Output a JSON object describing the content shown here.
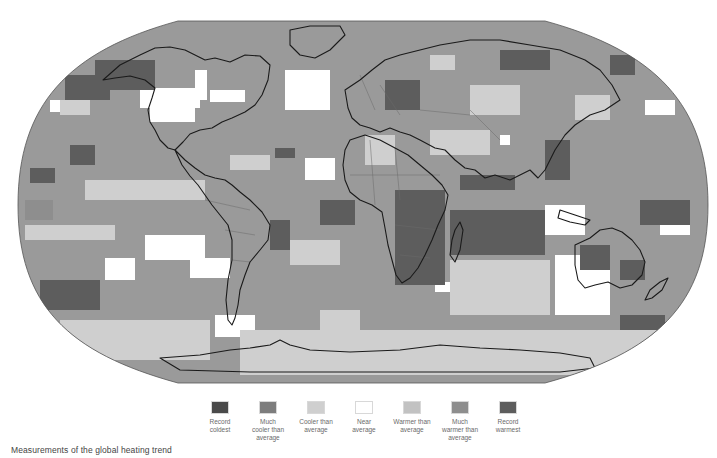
{
  "figure": {
    "caption": "Measurements of the global heating trend",
    "projection": "robinson",
    "outline": {
      "top_y": 21,
      "bottom_y": 383,
      "left_x": 18,
      "right_x": 708,
      "flat_top": [
        178,
        545
      ],
      "flat_bottom": [
        178,
        545
      ]
    }
  },
  "legend": {
    "items": [
      {
        "key": "record_coldest",
        "label": "Record\ncoldest",
        "color": "#4a4a4a"
      },
      {
        "key": "much_cooler",
        "label": "Much\ncooler than\naverage",
        "color": "#7d7d7d"
      },
      {
        "key": "cooler",
        "label": "Cooler than\naverage",
        "color": "#cfcfcf"
      },
      {
        "key": "near",
        "label": "Near\naverage",
        "color": "#ffffff"
      },
      {
        "key": "warmer",
        "label": "Warmer than\naverage",
        "color": "#c2c2c2"
      },
      {
        "key": "much_warmer",
        "label": "Much\nwarmer than\naverage",
        "color": "#8e8e8e"
      },
      {
        "key": "record_warmest",
        "label": "Record\nwarmest",
        "color": "#5d5d5d"
      }
    ]
  },
  "map": {
    "base_color": "#9a9a9a",
    "coast_color": "#1a1a1a",
    "border_color": "#6a6a6a",
    "cells": [
      {
        "x": 140,
        "y": 88,
        "w": 60,
        "h": 20,
        "c": "near"
      },
      {
        "x": 150,
        "y": 100,
        "w": 45,
        "h": 22,
        "c": "near"
      },
      {
        "x": 195,
        "y": 70,
        "w": 12,
        "h": 30,
        "c": "near"
      },
      {
        "x": 210,
        "y": 90,
        "w": 35,
        "h": 12,
        "c": "near"
      },
      {
        "x": 285,
        "y": 70,
        "w": 45,
        "h": 40,
        "c": "near"
      },
      {
        "x": 305,
        "y": 158,
        "w": 30,
        "h": 22,
        "c": "near"
      },
      {
        "x": 50,
        "y": 100,
        "w": 20,
        "h": 12,
        "c": "near"
      },
      {
        "x": 145,
        "y": 235,
        "w": 60,
        "h": 25,
        "c": "near"
      },
      {
        "x": 190,
        "y": 258,
        "w": 40,
        "h": 20,
        "c": "near"
      },
      {
        "x": 105,
        "y": 258,
        "w": 30,
        "h": 22,
        "c": "near"
      },
      {
        "x": 215,
        "y": 315,
        "w": 40,
        "h": 22,
        "c": "near"
      },
      {
        "x": 545,
        "y": 205,
        "w": 40,
        "h": 30,
        "c": "near"
      },
      {
        "x": 555,
        "y": 255,
        "w": 55,
        "h": 60,
        "c": "near"
      },
      {
        "x": 435,
        "y": 282,
        "w": 18,
        "h": 10,
        "c": "near"
      },
      {
        "x": 645,
        "y": 100,
        "w": 30,
        "h": 15,
        "c": "near"
      },
      {
        "x": 500,
        "y": 135,
        "w": 10,
        "h": 10,
        "c": "near"
      },
      {
        "x": 660,
        "y": 220,
        "w": 30,
        "h": 15,
        "c": "near"
      },
      {
        "x": 95,
        "y": 60,
        "w": 60,
        "h": 30,
        "c": "record_warmest"
      },
      {
        "x": 65,
        "y": 75,
        "w": 45,
        "h": 25,
        "c": "record_warmest"
      },
      {
        "x": 70,
        "y": 145,
        "w": 25,
        "h": 20,
        "c": "record_warmest"
      },
      {
        "x": 30,
        "y": 168,
        "w": 25,
        "h": 15,
        "c": "record_warmest"
      },
      {
        "x": 25,
        "y": 200,
        "w": 28,
        "h": 20,
        "c": "much_warmer"
      },
      {
        "x": 40,
        "y": 280,
        "w": 60,
        "h": 30,
        "c": "record_warmest"
      },
      {
        "x": 275,
        "y": 148,
        "w": 20,
        "h": 10,
        "c": "record_warmest"
      },
      {
        "x": 610,
        "y": 55,
        "w": 25,
        "h": 20,
        "c": "record_warmest"
      },
      {
        "x": 385,
        "y": 80,
        "w": 35,
        "h": 30,
        "c": "record_warmest"
      },
      {
        "x": 500,
        "y": 50,
        "w": 50,
        "h": 20,
        "c": "record_warmest"
      },
      {
        "x": 460,
        "y": 175,
        "w": 55,
        "h": 15,
        "c": "record_warmest"
      },
      {
        "x": 545,
        "y": 140,
        "w": 25,
        "h": 40,
        "c": "record_warmest"
      },
      {
        "x": 450,
        "y": 210,
        "w": 95,
        "h": 45,
        "c": "record_warmest"
      },
      {
        "x": 395,
        "y": 190,
        "w": 50,
        "h": 95,
        "c": "record_warmest"
      },
      {
        "x": 320,
        "y": 200,
        "w": 35,
        "h": 25,
        "c": "record_warmest"
      },
      {
        "x": 580,
        "y": 245,
        "w": 30,
        "h": 25,
        "c": "record_warmest"
      },
      {
        "x": 620,
        "y": 260,
        "w": 25,
        "h": 20,
        "c": "record_warmest"
      },
      {
        "x": 640,
        "y": 200,
        "w": 50,
        "h": 25,
        "c": "record_warmest"
      },
      {
        "x": 620,
        "y": 315,
        "w": 45,
        "h": 25,
        "c": "record_warmest"
      },
      {
        "x": 490,
        "y": 275,
        "w": 45,
        "h": 35,
        "c": "much_warmer"
      },
      {
        "x": 270,
        "y": 220,
        "w": 20,
        "h": 30,
        "c": "record_warmest"
      },
      {
        "x": 60,
        "y": 100,
        "w": 30,
        "h": 15,
        "c": "cooler"
      },
      {
        "x": 25,
        "y": 225,
        "w": 90,
        "h": 15,
        "c": "cooler"
      },
      {
        "x": 85,
        "y": 180,
        "w": 120,
        "h": 20,
        "c": "cooler"
      },
      {
        "x": 430,
        "y": 130,
        "w": 60,
        "h": 25,
        "c": "cooler"
      },
      {
        "x": 470,
        "y": 85,
        "w": 50,
        "h": 30,
        "c": "cooler"
      },
      {
        "x": 430,
        "y": 55,
        "w": 25,
        "h": 15,
        "c": "cooler"
      },
      {
        "x": 365,
        "y": 135,
        "w": 30,
        "h": 30,
        "c": "cooler"
      },
      {
        "x": 575,
        "y": 95,
        "w": 35,
        "h": 25,
        "c": "cooler"
      },
      {
        "x": 230,
        "y": 155,
        "w": 40,
        "h": 15,
        "c": "cooler"
      },
      {
        "x": 290,
        "y": 240,
        "w": 50,
        "h": 25,
        "c": "cooler"
      },
      {
        "x": 320,
        "y": 310,
        "w": 40,
        "h": 20,
        "c": "cooler"
      },
      {
        "x": 60,
        "y": 320,
        "w": 150,
        "h": 40,
        "c": "cooler"
      },
      {
        "x": 240,
        "y": 330,
        "w": 420,
        "h": 45,
        "c": "cooler"
      },
      {
        "x": 450,
        "y": 260,
        "w": 100,
        "h": 55,
        "c": "cooler"
      }
    ],
    "coasts": [
      "M103,80 L120,65 L140,55 L155,48 L170,47 L185,50 L195,55 L205,60 L215,58 L230,62 L245,55 L260,56 L270,65 L268,80 L262,95 L255,105 L245,112 L232,118 L222,122 L212,128 L200,130 L190,134 L183,142 L175,150 L168,148 L160,140 L155,130 L150,122 L148,110 L152,98 L155,88 L145,80 L130,76 L115,78 Z",
      "M175,150 L185,160 L195,168 L205,175 L215,178 L225,180 L232,185 L240,192 L250,200 L262,212 L270,225 L268,240 L260,250 L250,262 L245,275 L240,290 L238,305 L235,318 L232,325 L228,320 L226,300 L228,280 L232,260 L232,240 L228,225 L220,215 L212,205 L205,195 L198,185 L190,176 L182,165 Z",
      "M290,30 L310,26 L340,26 L345,35 L330,50 L315,58 L300,55 L290,45 Z",
      "M345,90 L360,80 L372,70 L385,60 L400,55 L420,50 L440,45 L470,40 L500,40 L530,45 L560,50 L585,60 L600,70 L612,85 L620,100 L605,110 L590,115 L575,125 L565,135 L555,150 L550,160 L545,170 L538,178 L530,170 L520,175 L510,180 L495,175 L485,178 L475,170 L465,168 L455,160 L445,150 L435,148 L420,140 L410,135 L400,132 L390,128 L380,132 L370,128 L360,125 L352,118 L348,108 Z",
      "M350,140 L365,135 L380,140 L395,148 L408,155 L420,165 L432,175 L442,185 L448,195 L445,210 L438,225 L432,240 L425,255 L418,268 L410,278 L402,283 L396,275 L392,260 L388,245 L385,228 L382,212 L372,205 L360,200 L350,192 L345,180 L343,165 L345,150 Z",
      "M455,230 L460,222 L463,230 L460,250 L455,262 L450,255 L452,240 Z",
      "M575,245 L590,238 L600,230 L612,228 L622,232 L632,240 L640,250 L645,262 L642,275 L632,285 L620,288 L608,282 L595,285 L585,288 L578,280 L575,265 Z",
      "M650,290 L660,282 L668,278 L662,290 L652,298 L645,300 Z",
      "M560,210 L575,215 L590,220 L585,225 L570,222 L558,218 Z",
      "M160,358 L200,355 L230,350 L250,348 L270,345 L280,340 L290,345 L310,350 L350,352 L400,350 L440,345 L480,348 L520,350 L560,353 L590,358 L595,368 L560,372 L400,372 L250,372 L180,370 Z"
    ],
    "borders": [
      "M350,175 L440,175",
      "M370,140 L375,205",
      "M395,148 L400,200",
      "M395,225 L440,230",
      "M400,255 L430,258",
      "M360,75 L375,110",
      "M380,85 L400,115",
      "M420,110 L470,115",
      "M470,110 L500,140",
      "M205,200 L250,210",
      "M225,230 L255,235",
      "M232,260 L250,262"
    ]
  }
}
